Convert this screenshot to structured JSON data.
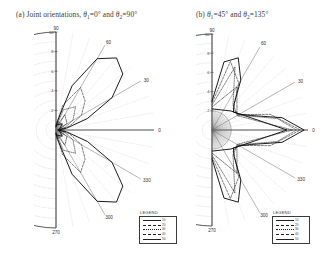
{
  "figure": {
    "panels": [
      {
        "id": "a",
        "caption_prefix": "(a) Joint orientations, ",
        "caption_sym1": "θ",
        "caption_sub1": "1",
        "caption_val1": "=0°",
        "caption_mid": " and ",
        "caption_sym2": "θ",
        "caption_sub2": "2",
        "caption_val2": "=90°",
        "legend_title": "LEGEND"
      },
      {
        "id": "b",
        "caption_prefix": "(b) ",
        "caption_sym1": "θ",
        "caption_sub1": "1",
        "caption_val1": "=45°",
        "caption_mid": " and ",
        "caption_sym2": "θ",
        "caption_sub2": "2",
        "caption_val2": "=135°",
        "legend_title": "LEGEND"
      }
    ]
  },
  "legend": {
    "entries": [
      {
        "label": "10",
        "style": "solid"
      },
      {
        "label": "20",
        "style": "dashed"
      },
      {
        "label": "30",
        "style": "dotted"
      },
      {
        "label": "40",
        "style": "dashdot"
      },
      {
        "label": "50",
        "style": "solid"
      }
    ]
  },
  "chart_data": [
    {
      "type": "line",
      "subtype": "polar-half",
      "title": "(a) Joint orientations, θ1=0° and θ2=90°",
      "theta_labels": [
        "90",
        "60",
        "30",
        "0",
        "330",
        "300",
        "270"
      ],
      "theta_values": [
        90,
        60,
        30,
        0,
        330,
        300,
        270
      ],
      "theta_range": [
        -90,
        90
      ],
      "theta_grid_step": 10,
      "r_labels": [
        "10",
        "8",
        "6",
        "4",
        "2"
      ],
      "r_values": [
        10,
        8,
        6,
        4,
        2
      ],
      "rlim": [
        0,
        10
      ],
      "r_grid_step": 1,
      "grid": true,
      "legend_position": "bottom-right",
      "annotation": "Two large symmetric main lobes centered near +50° and −50°; dense dashed sub-lobe fan near the origin; null along 0° axis.",
      "series": [
        {
          "name": "10",
          "style": "solid",
          "theta": [
            -90,
            -80,
            -70,
            -60,
            -50,
            -40,
            -30,
            -20,
            -10,
            0,
            10,
            20,
            30,
            40,
            50,
            60,
            70,
            80,
            90
          ],
          "r": [
            0.4,
            1.0,
            4.8,
            8.4,
            9.6,
            8.9,
            6.6,
            3.4,
            1.1,
            0.2,
            1.1,
            3.4,
            6.6,
            8.9,
            9.6,
            8.4,
            4.8,
            1.0,
            0.4
          ]
        },
        {
          "name": "20",
          "style": "dashed",
          "theta": [
            -90,
            -75,
            -60,
            -45,
            -30,
            -15,
            0,
            15,
            30,
            45,
            60,
            75,
            90
          ],
          "r": [
            0.3,
            2.6,
            5.0,
            4.2,
            3.0,
            1.4,
            0.2,
            1.4,
            3.0,
            4.2,
            5.0,
            2.6,
            0.3
          ]
        },
        {
          "name": "30",
          "style": "dotted",
          "theta": [
            -90,
            -70,
            -50,
            -30,
            -10,
            0,
            10,
            30,
            50,
            70,
            90
          ],
          "r": [
            0.3,
            2.2,
            3.1,
            2.0,
            0.8,
            0.2,
            0.8,
            2.0,
            3.1,
            2.2,
            0.3
          ]
        },
        {
          "name": "40",
          "style": "dashdot",
          "theta": [
            -90,
            -60,
            -30,
            0,
            30,
            60,
            90
          ],
          "r": [
            0.3,
            1.8,
            1.3,
            0.2,
            1.3,
            1.8,
            0.3
          ]
        },
        {
          "name": "50",
          "style": "solid",
          "theta": [
            -90,
            -45,
            0,
            45,
            90
          ],
          "r": [
            0.5,
            0.9,
            0.3,
            0.9,
            0.5
          ]
        }
      ]
    },
    {
      "type": "line",
      "subtype": "polar-half",
      "title": "(b) θ1=45° and θ2=135°",
      "theta_labels": [
        "90",
        "60",
        "30",
        "0",
        "330",
        "300",
        "270"
      ],
      "theta_values": [
        90,
        60,
        30,
        0,
        330,
        300,
        270
      ],
      "theta_range": [
        -90,
        90
      ],
      "theta_grid_step": 10,
      "r_labels": [
        "10",
        "8",
        "6",
        "4",
        "2"
      ],
      "r_values": [
        10,
        8,
        6,
        4,
        2
      ],
      "rlim": [
        0,
        10
      ],
      "r_grid_step": 1,
      "grid": true,
      "legend_position": "bottom-right",
      "annotation": "Single dominant forward lobe along 0° reaching the outer ring, with shoulder lobes near ±75° and a dense shaded core near the origin.",
      "series": [
        {
          "name": "10",
          "style": "solid",
          "theta": [
            -90,
            -80,
            -70,
            -60,
            -50,
            -40,
            -30,
            -20,
            -10,
            0,
            10,
            20,
            30,
            40,
            50,
            60,
            70,
            80,
            90
          ],
          "r": [
            3.0,
            7.2,
            8.0,
            6.0,
            3.6,
            2.9,
            3.3,
            4.4,
            7.4,
            9.6,
            7.4,
            4.4,
            3.3,
            2.9,
            3.6,
            6.0,
            8.0,
            7.2,
            3.0
          ]
        },
        {
          "name": "20",
          "style": "dashed",
          "theta": [
            -90,
            -75,
            -60,
            -45,
            -30,
            -15,
            0,
            15,
            30,
            45,
            60,
            75,
            90
          ],
          "r": [
            2.8,
            7.4,
            5.6,
            3.1,
            3.2,
            6.3,
            9.2,
            6.3,
            3.2,
            3.1,
            5.6,
            7.4,
            2.8
          ]
        },
        {
          "name": "30",
          "style": "dotted",
          "theta": [
            -90,
            -70,
            -50,
            -30,
            -10,
            0,
            10,
            30,
            50,
            70,
            90
          ],
          "r": [
            2.6,
            7.0,
            3.4,
            3.1,
            6.9,
            8.8,
            6.9,
            3.1,
            3.4,
            7.0,
            2.6
          ]
        },
        {
          "name": "40",
          "style": "dashdot",
          "theta": [
            -90,
            -60,
            -30,
            0,
            30,
            60,
            90
          ],
          "r": [
            2.4,
            5.2,
            3.0,
            8.4,
            3.0,
            5.2,
            2.4
          ]
        },
        {
          "name": "50",
          "style": "solid",
          "theta": [
            -90,
            -45,
            0,
            45,
            90
          ],
          "r": [
            2.2,
            2.8,
            7.8,
            2.8,
            2.2
          ]
        }
      ]
    }
  ]
}
